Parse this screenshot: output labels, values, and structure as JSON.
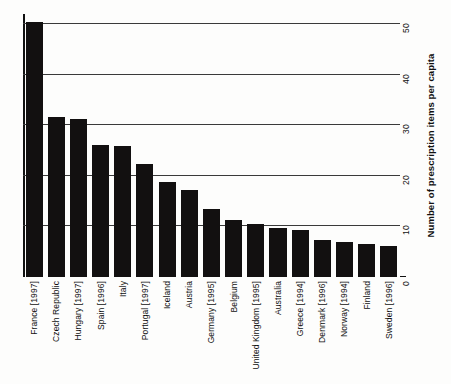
{
  "chart_data": {
    "type": "bar",
    "title": "",
    "xlabel": "",
    "ylabel": "Number of prescription items per capita",
    "ylim": [
      0,
      52
    ],
    "yticks": [
      0,
      10,
      20,
      30,
      40,
      50
    ],
    "grid": true,
    "legend": "none",
    "orientation": "vertical",
    "bar_color": "#121010",
    "categories": [
      "France [1997]",
      "Czech Republic",
      "Hungary [1997]",
      "Spain [1996]",
      "Italy",
      "Portugal [1997]",
      "Iceland",
      "Austria",
      "Germany [1995]",
      "Belgium",
      "United Kingdom [1995]",
      "Australia",
      "Greece [1994]",
      "Denmark [1996]",
      "Norway [1994]",
      "Finland",
      "Sweden [1996]"
    ],
    "values": [
      50.5,
      31.7,
      31.3,
      26.2,
      26.0,
      22.3,
      18.7,
      17.3,
      13.5,
      11.2,
      10.4,
      9.6,
      9.2,
      7.3,
      6.9,
      6.5,
      6.2
    ]
  },
  "axis": {
    "tick_0": "0",
    "tick_10": "10",
    "tick_20": "20",
    "tick_30": "30",
    "tick_40": "40",
    "tick_50": "50"
  }
}
